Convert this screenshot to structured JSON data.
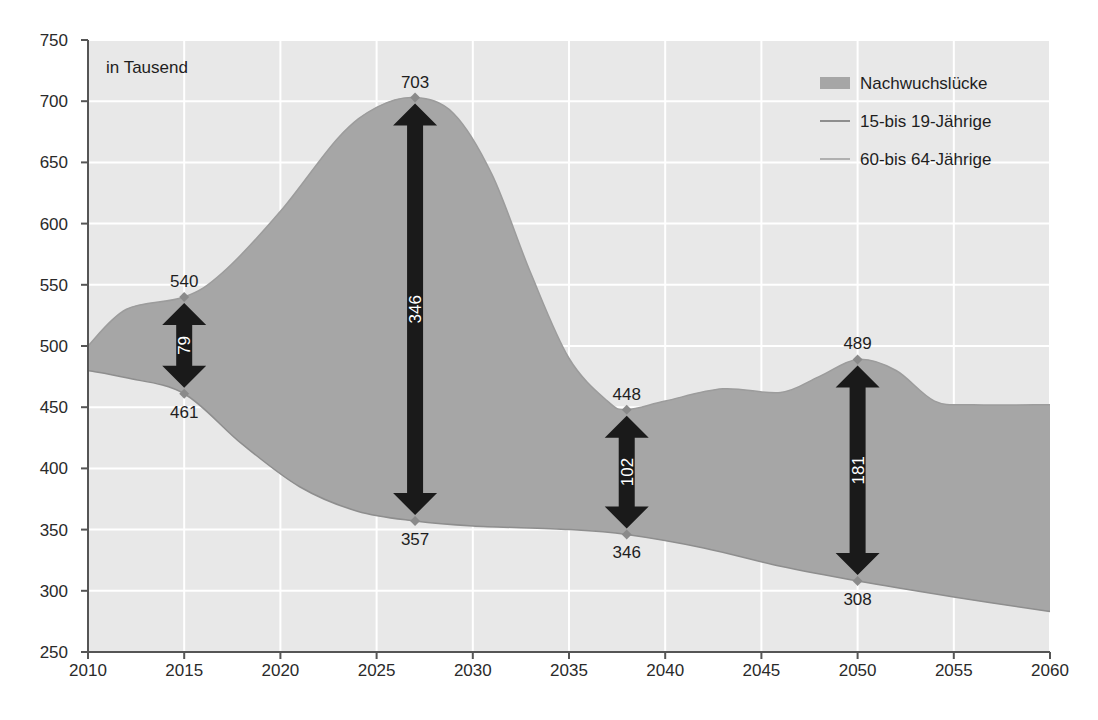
{
  "chart_data": {
    "type": "area",
    "title": "",
    "unit_note": "in Tausend",
    "xlabel": "",
    "ylabel": "",
    "xlim": [
      2010,
      2060
    ],
    "ylim": [
      250,
      750
    ],
    "x_ticks": [
      "2010",
      "2015",
      "2020",
      "2025",
      "2030",
      "2035",
      "2040",
      "2045",
      "2050",
      "2055",
      "2060"
    ],
    "y_ticks": [
      "250",
      "300",
      "350",
      "400",
      "450",
      "500",
      "550",
      "600",
      "650",
      "700",
      "750"
    ],
    "grid": true,
    "legend_position": "top-right",
    "legend": [
      {
        "label": "Nachwuchslücke",
        "type": "area"
      },
      {
        "label": "15-bis 19-Jährige",
        "type": "line"
      },
      {
        "label": "60-bis 64-Jährige",
        "type": "line"
      }
    ],
    "series": [
      {
        "name": "60-bis 64-Jährige",
        "x": [
          2010,
          2012,
          2015,
          2017,
          2020,
          2023,
          2025,
          2027,
          2029,
          2031,
          2033,
          2035,
          2037,
          2038,
          2040,
          2043,
          2046,
          2048,
          2050,
          2052,
          2054,
          2056,
          2060
        ],
        "values": [
          500,
          530,
          540,
          560,
          610,
          670,
          695,
          703,
          690,
          640,
          560,
          490,
          455,
          448,
          455,
          465,
          462,
          475,
          489,
          480,
          455,
          452,
          452
        ]
      },
      {
        "name": "15-bis 19-Jährige",
        "x": [
          2010,
          2012,
          2015,
          2018,
          2021,
          2024,
          2027,
          2030,
          2035,
          2038,
          2042,
          2046,
          2050,
          2055,
          2060
        ],
        "values": [
          480,
          474,
          461,
          420,
          385,
          365,
          357,
          353,
          350,
          346,
          335,
          320,
          308,
          295,
          283
        ]
      }
    ],
    "annotations": [
      {
        "year": 2015,
        "upper": 540,
        "lower": 461,
        "gap": 79
      },
      {
        "year": 2027,
        "upper": 703,
        "lower": 357,
        "gap": 346
      },
      {
        "year": 2038,
        "upper": 448,
        "lower": 346,
        "gap": 102
      },
      {
        "year": 2050,
        "upper": 489,
        "lower": 308,
        "gap": 181
      }
    ]
  },
  "colors": {
    "plot_background": "#e8e8e8",
    "gridline": "#ffffff",
    "gap_fill": "#a6a6a6",
    "arrow": "#1a1a1a",
    "axis": "#555555",
    "marker": "#8a8a8a"
  }
}
